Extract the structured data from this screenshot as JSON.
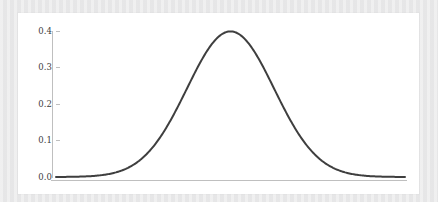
{
  "figure": {
    "background_color": "#e9e9ea",
    "card_color": "#ffffff"
  },
  "chart_data": {
    "type": "line",
    "title": "",
    "subtitle": "",
    "xlabel": "",
    "ylabel": "",
    "curve_label": "standard normal probability density",
    "line_color": "#3f3f3f",
    "line_width": 2,
    "axis_color": "#bfbfbf",
    "tick_label_color": "#3c3c3c",
    "grid": false,
    "legend": false,
    "legend_position": "none",
    "xlim": [
      -4.0,
      4.0
    ],
    "ylim": [
      0.0,
      0.42
    ],
    "xticks": [],
    "xtick_labels": [],
    "yticks": [
      0.0,
      0.1,
      0.2,
      0.3,
      0.4
    ],
    "ytick_labels": [
      "0.0",
      "0.1",
      "0.2",
      "0.3",
      "0.4"
    ],
    "series": [
      {
        "name": "normal pdf",
        "x": [
          -4.0,
          -3.8,
          -3.6,
          -3.4,
          -3.2,
          -3.0,
          -2.8,
          -2.6,
          -2.4,
          -2.2,
          -2.0,
          -1.8,
          -1.6,
          -1.4,
          -1.2,
          -1.0,
          -0.8,
          -0.6,
          -0.4,
          -0.2,
          0.0,
          0.2,
          0.4,
          0.6,
          0.8,
          1.0,
          1.2,
          1.4,
          1.6,
          1.8,
          2.0,
          2.2,
          2.4,
          2.6,
          2.8,
          3.0,
          3.2,
          3.4,
          3.6,
          3.8,
          4.0
        ],
        "values": [
          0.0001,
          0.0003,
          0.0006,
          0.0012,
          0.0024,
          0.0044,
          0.0079,
          0.0136,
          0.0224,
          0.0355,
          0.054,
          0.079,
          0.1109,
          0.1497,
          0.1942,
          0.242,
          0.2897,
          0.3332,
          0.3683,
          0.391,
          0.3989,
          0.391,
          0.3683,
          0.3332,
          0.2897,
          0.242,
          0.1942,
          0.1497,
          0.1109,
          0.079,
          0.054,
          0.0355,
          0.0224,
          0.0136,
          0.0079,
          0.0044,
          0.0024,
          0.0012,
          0.0006,
          0.0003,
          0.0001
        ]
      }
    ],
    "peak": {
      "x": 0.0,
      "y": 0.3989
    }
  }
}
